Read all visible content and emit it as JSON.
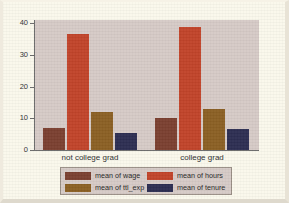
{
  "chart_data": {
    "type": "bar",
    "title": "",
    "subtitle": "",
    "xlabel": "",
    "ylabel": "",
    "grid": false,
    "legend_position": "bottom",
    "categories": [
      "not college grad",
      "college grad"
    ],
    "yticks": [
      "0",
      "10",
      "20",
      "30",
      "40"
    ],
    "ytick_values": [
      0,
      10,
      20,
      30,
      40
    ],
    "ylim": [
      0,
      41
    ],
    "series": [
      {
        "name": "mean of wage",
        "values": [
          6.8,
          10.2
        ],
        "color": "#7b4030"
      },
      {
        "name": "mean of hours",
        "values": [
          36.6,
          38.8
        ],
        "color": "#c1442a"
      },
      {
        "name": "mean of ttl_exp",
        "values": [
          12.0,
          13.0
        ],
        "color": "#8b6024"
      },
      {
        "name": "mean of tenure",
        "values": [
          5.5,
          6.6
        ],
        "color": "#2d2e52"
      }
    ]
  },
  "legend": {
    "entries": [
      {
        "label": "mean of wage",
        "color": "#7b4030"
      },
      {
        "label": "mean of hours",
        "color": "#c1442a"
      },
      {
        "label": "mean of ttl_exp",
        "color": "#8b6024"
      },
      {
        "label": "mean of tenure",
        "color": "#2d2e52"
      }
    ]
  },
  "colors": {
    "page_background": "#faf8ec",
    "plot_background": "#d6cbc7",
    "axis": "#6b6b6b",
    "legend_border": "#9a8f86",
    "text": "#2f2f2f"
  }
}
